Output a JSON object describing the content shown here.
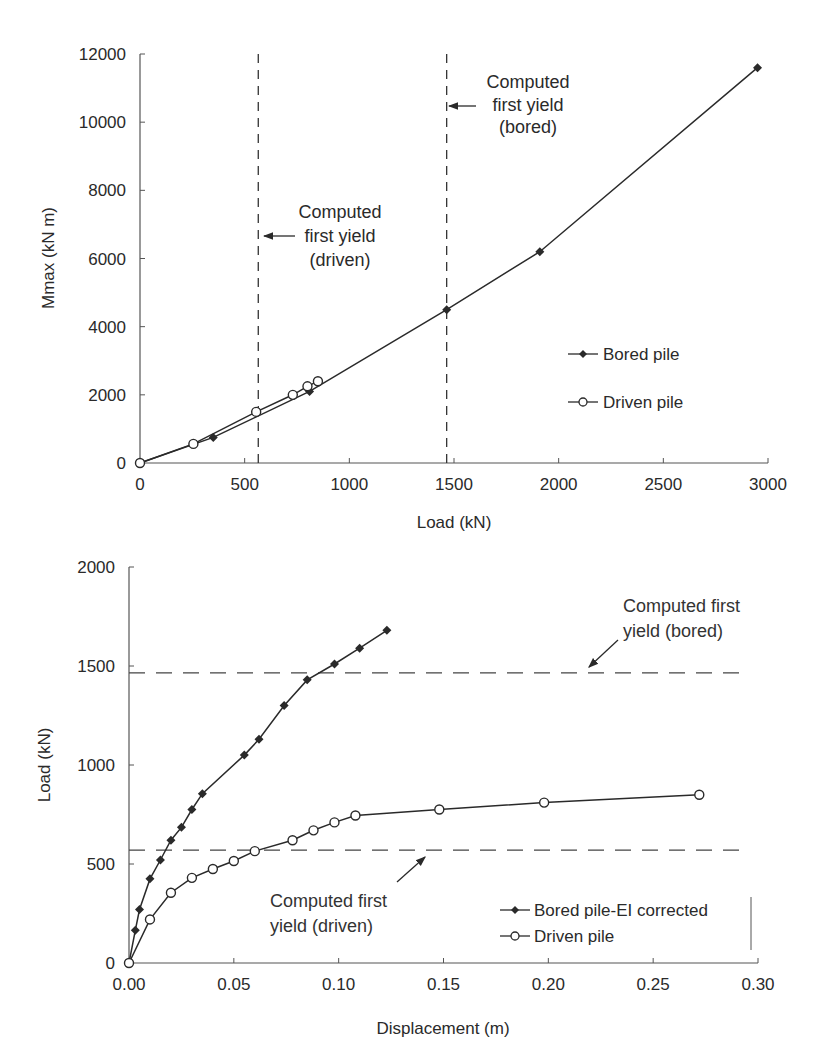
{
  "chart_data": [
    {
      "type": "line",
      "title": "",
      "xlabel": "Load (kN)",
      "ylabel": "Mmax (kN m)",
      "xlim": [
        0,
        3000
      ],
      "ylim": [
        0,
        12000
      ],
      "xticks": [
        0,
        500,
        1000,
        1500,
        2000,
        2500,
        3000
      ],
      "yticks": [
        0,
        2000,
        4000,
        6000,
        8000,
        10000,
        12000
      ],
      "grid": false,
      "legend_position": "right-middle",
      "series": [
        {
          "name": "Bored pile",
          "marker": "filled-diamond",
          "x": [
            0,
            350,
            810,
            1465,
            1910,
            2950
          ],
          "y": [
            0,
            750,
            2100,
            4500,
            6200,
            11600
          ]
        },
        {
          "name": "Driven pile",
          "marker": "open-circle",
          "x": [
            0,
            255,
            555,
            730,
            800,
            850
          ],
          "y": [
            0,
            560,
            1500,
            2000,
            2250,
            2400
          ]
        }
      ],
      "reference_lines": [
        {
          "orientation": "vertical",
          "value": 565,
          "style": "dashed",
          "label": "Computed first yield (driven)"
        },
        {
          "orientation": "vertical",
          "value": 1465,
          "style": "dashed",
          "label": "Computed first yield (bored)"
        }
      ],
      "annotations": [
        {
          "lines": [
            "Computed",
            "first yield",
            "(driven)"
          ],
          "arrow_to": "driven yield line"
        },
        {
          "lines": [
            "Computed",
            "first yield",
            "(bored)"
          ],
          "arrow_to": "bored yield line"
        }
      ]
    },
    {
      "type": "line",
      "title": "",
      "xlabel": "Displacement (m)",
      "ylabel": "Load (kN)",
      "xlim": [
        0,
        0.3
      ],
      "ylim": [
        0,
        2000
      ],
      "xticks": [
        "0.00",
        "0.05",
        "0.10",
        "0.15",
        "0.20",
        "0.25",
        "0.30"
      ],
      "yticks": [
        0,
        500,
        1000,
        1500,
        2000
      ],
      "grid": false,
      "legend_position": "bottom-right",
      "series": [
        {
          "name": "Bored pile-EI corrected",
          "marker": "filled-diamond",
          "x": [
            0,
            0.003,
            0.005,
            0.01,
            0.015,
            0.02,
            0.025,
            0.03,
            0.035,
            0.055,
            0.062,
            0.074,
            0.085,
            0.098,
            0.11,
            0.123
          ],
          "y": [
            0,
            165,
            270,
            425,
            520,
            620,
            685,
            775,
            855,
            1050,
            1130,
            1300,
            1430,
            1510,
            1590,
            1680
          ]
        },
        {
          "name": "Driven pile",
          "marker": "open-circle",
          "x": [
            0,
            0.01,
            0.02,
            0.03,
            0.04,
            0.05,
            0.06,
            0.078,
            0.088,
            0.098,
            0.108,
            0.148,
            0.198,
            0.272
          ],
          "y": [
            0,
            220,
            355,
            430,
            475,
            515,
            565,
            620,
            670,
            710,
            745,
            775,
            810,
            850
          ]
        }
      ],
      "reference_lines": [
        {
          "orientation": "horizontal",
          "value": 1465,
          "style": "dashed",
          "label": "Computed first yield (bored)"
        },
        {
          "orientation": "horizontal",
          "value": 570,
          "style": "dashed",
          "label": "Computed first yield (driven)"
        }
      ],
      "annotations": [
        {
          "lines": [
            "Computed first",
            "yield (bored)"
          ],
          "arrow_to": "bored yield line"
        },
        {
          "lines": [
            "Computed first",
            "yield (driven)"
          ],
          "arrow_to": "driven yield line"
        }
      ]
    }
  ],
  "top_chart": {
    "xlabel": "Load (kN)",
    "ylabel": "Mmax (kN m)",
    "xtick_labels": [
      "0",
      "500",
      "1000",
      "1500",
      "2000",
      "2500",
      "3000"
    ],
    "ytick_labels": [
      "0",
      "2000",
      "4000",
      "6000",
      "8000",
      "10000",
      "12000"
    ],
    "legend": [
      "Bored pile",
      "Driven pile"
    ],
    "annot_driven": [
      "Computed",
      "first yield",
      "(driven)"
    ],
    "annot_bored": [
      "Computed",
      "first yield",
      "(bored)"
    ]
  },
  "bottom_chart": {
    "xlabel": "Displacement (m)",
    "ylabel": "Load (kN)",
    "xtick_labels": [
      "0.00",
      "0.05",
      "0.10",
      "0.15",
      "0.20",
      "0.25",
      "0.30"
    ],
    "ytick_labels": [
      "0",
      "500",
      "1000",
      "1500",
      "2000"
    ],
    "legend": [
      "Bored pile-EI corrected",
      "Driven pile"
    ],
    "annot_bored": [
      "Computed first",
      "yield (bored)"
    ],
    "annot_driven": [
      "Computed first",
      "yield (driven)"
    ]
  }
}
